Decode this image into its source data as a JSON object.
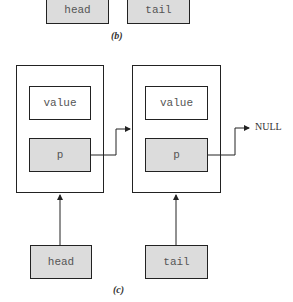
{
  "figure_b": {
    "caption": "(b)",
    "pointers": [
      {
        "label": "head"
      },
      {
        "label": "tail"
      }
    ]
  },
  "figure_c": {
    "caption": "(c)",
    "nodes": [
      {
        "value_label": "value",
        "pointer_label": "p"
      },
      {
        "value_label": "value",
        "pointer_label": "p"
      }
    ],
    "null_label": "NULL",
    "pointers": [
      {
        "label": "head"
      },
      {
        "label": "tail"
      }
    ]
  }
}
